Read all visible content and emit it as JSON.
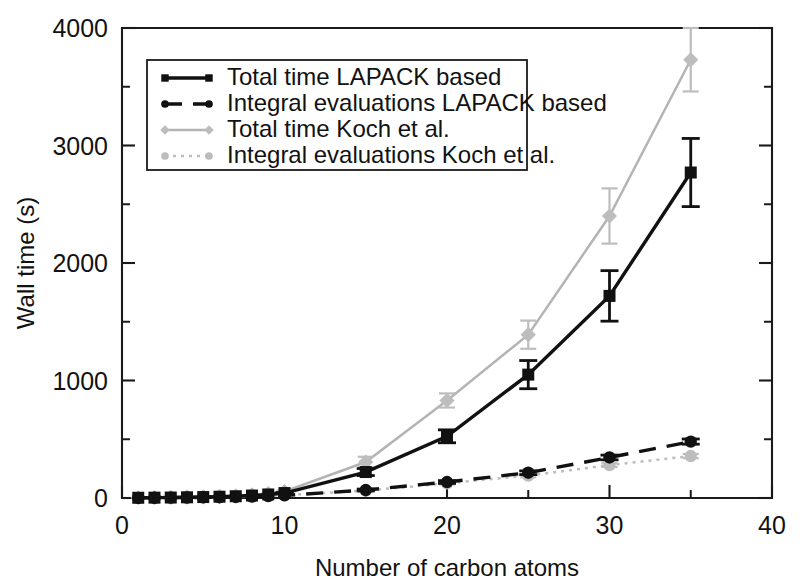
{
  "chart_data": {
    "type": "line",
    "title": "",
    "xlabel": "Number of carbon atoms",
    "ylabel": "Wall time (s)",
    "xlim": [
      0,
      40
    ],
    "ylim": [
      0,
      4000
    ],
    "xticks": [
      0,
      10,
      20,
      30,
      40
    ],
    "xtick_labels": [
      "0",
      "10",
      "20",
      "30",
      "40"
    ],
    "xticks_minor": [
      5,
      15,
      25,
      35
    ],
    "yticks": [
      0,
      1000,
      2000,
      3000,
      4000
    ],
    "ytick_labels": [
      "0",
      "1000",
      "2000",
      "3000",
      "4000"
    ],
    "yticks_minor": [
      500,
      1500,
      2500,
      3500
    ],
    "grid": false,
    "legend_position": "upper left inside",
    "error_bars": true,
    "series": [
      {
        "name": "Total time LAPACK based",
        "color": "#111111",
        "marker": "square",
        "linestyle": "solid",
        "x": [
          1,
          2,
          3,
          4,
          5,
          6,
          7,
          8,
          9,
          10,
          15,
          20,
          25,
          30,
          35
        ],
        "values": [
          2,
          3,
          4,
          6,
          8,
          11,
          15,
          21,
          30,
          42,
          221,
          525,
          1050,
          1720,
          2770
        ],
        "yerr": [
          0,
          0,
          0,
          0,
          0,
          0,
          0,
          0,
          0,
          5,
          30,
          55,
          120,
          215,
          290
        ]
      },
      {
        "name": "Integral evaluations LAPACK based",
        "color": "#111111",
        "marker": "circle",
        "linestyle": "dashed",
        "x": [
          1,
          2,
          3,
          4,
          5,
          6,
          7,
          8,
          9,
          10,
          15,
          20,
          25,
          30,
          35
        ],
        "values": [
          1,
          2,
          3,
          4,
          5,
          7,
          9,
          12,
          16,
          22,
          68,
          136,
          215,
          345,
          480
        ],
        "yerr": [
          0,
          0,
          0,
          0,
          0,
          0,
          0,
          0,
          0,
          0,
          8,
          12,
          16,
          20,
          22
        ]
      },
      {
        "name": "Total time Koch et al.",
        "color": "#bdbdbd",
        "marker": "diamond",
        "linestyle": "solid",
        "x": [
          1,
          2,
          3,
          4,
          5,
          6,
          7,
          8,
          9,
          10,
          15,
          20,
          25,
          30,
          35
        ],
        "values": [
          2,
          3,
          5,
          7,
          10,
          14,
          19,
          27,
          38,
          55,
          306,
          830,
          1390,
          2400,
          3730
        ],
        "yerr": [
          0,
          0,
          0,
          0,
          0,
          0,
          0,
          0,
          0,
          8,
          45,
          60,
          120,
          235,
          270
        ]
      },
      {
        "name": "Integral evaluations Koch et al.",
        "color": "#bdbdbd",
        "marker": "circle",
        "linestyle": "dotted",
        "x": [
          1,
          2,
          3,
          4,
          5,
          6,
          7,
          8,
          9,
          10,
          15,
          20,
          25,
          30,
          35
        ],
        "values": [
          1,
          2,
          3,
          4,
          5,
          7,
          10,
          13,
          18,
          25,
          62,
          125,
          190,
          280,
          357
        ],
        "yerr": [
          0,
          0,
          0,
          0,
          0,
          0,
          0,
          0,
          0,
          0,
          6,
          10,
          14,
          16,
          18
        ]
      }
    ],
    "legend_entries": [
      {
        "label": "Total time LAPACK based",
        "color": "#111111",
        "marker": "square",
        "linestyle": "solid"
      },
      {
        "label": "Integral evaluations LAPACK based",
        "color": "#111111",
        "marker": "circle",
        "linestyle": "dashed"
      },
      {
        "label": "Total time Koch et al.",
        "color": "#bdbdbd",
        "marker": "diamond",
        "linestyle": "solid"
      },
      {
        "label": "Integral evaluations Koch et al.",
        "color": "#bdbdbd",
        "marker": "circle",
        "linestyle": "dotted"
      }
    ]
  }
}
